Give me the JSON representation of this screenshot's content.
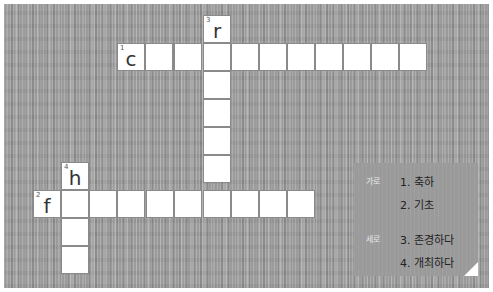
{
  "puzzle": {
    "across": {
      "label": "가로",
      "clues": [
        {
          "text": "1. 축하"
        },
        {
          "text": "2. 기초"
        }
      ]
    },
    "down": {
      "label": "세로",
      "clues": [
        {
          "text": "3. 존경하다"
        },
        {
          "text": "4. 개최하다"
        }
      ]
    },
    "words": [
      {
        "number": "1",
        "direction": "across",
        "first_letter": "c",
        "length": 11
      },
      {
        "number": "2",
        "direction": "across",
        "first_letter": "f",
        "length": 10
      },
      {
        "number": "3",
        "direction": "down",
        "first_letter": "r",
        "length": 7
      },
      {
        "number": "4",
        "direction": "down",
        "first_letter": "h",
        "length": 4
      }
    ]
  }
}
